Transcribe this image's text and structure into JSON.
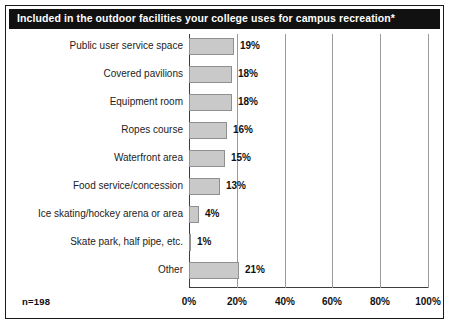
{
  "figure": {
    "title": "Included in the outdoor facilities your college uses for campus recreation*",
    "sample_size_label": "n=198",
    "colors": {
      "banner_background": "#111111",
      "banner_text": "#ffffff",
      "bar_fill": "#c9c9c9",
      "bar_border": "#8f8f8f",
      "gridline": "#9a9a9a",
      "axis": "#3c3c3c",
      "border": "#1a1a1a",
      "background": "#ffffff"
    }
  },
  "chart_data": {
    "type": "bar",
    "orientation": "horizontal",
    "title": "Included in the outdoor facilities your college uses for campus recreation*",
    "xlabel": "",
    "ylabel": "",
    "xlim": [
      0,
      100
    ],
    "grid": true,
    "legend": false,
    "xticks": [
      "0%",
      "20%",
      "40%",
      "60%",
      "80%",
      "100%"
    ],
    "xtick_values": [
      0,
      20,
      40,
      60,
      80,
      100
    ],
    "categories": [
      "Public user service space",
      "Covered pavilions",
      "Equipment room",
      "Ropes course",
      "Waterfront area",
      "Food service/concession",
      "Ice skating/hockey arena or area",
      "Skate park, half pipe, etc.",
      "Other"
    ],
    "values": [
      19,
      18,
      18,
      16,
      15,
      13,
      4,
      1,
      21
    ],
    "value_labels": [
      "19%",
      "18%",
      "18%",
      "16%",
      "15%",
      "13%",
      "4%",
      "1%",
      "21%"
    ],
    "annotations": [
      "n=198"
    ]
  }
}
